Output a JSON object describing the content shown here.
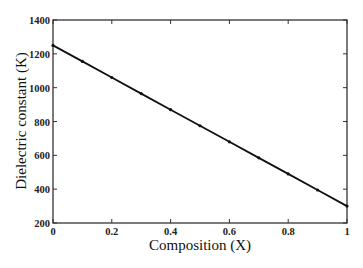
{
  "chart_data": {
    "type": "line",
    "title": "",
    "xlabel": "Composition (X)",
    "ylabel": "Dielectric constant (K)",
    "xlim": [
      0,
      1
    ],
    "ylim": [
      200,
      1400
    ],
    "grid": false,
    "legend": null,
    "xticks": [
      0,
      0.2,
      0.4,
      0.6,
      0.8,
      1
    ],
    "xtick_labels": [
      "0",
      "0.2",
      "0.4",
      "0.6",
      "0.8",
      "1"
    ],
    "yticks": [
      200,
      400,
      600,
      800,
      1000,
      1200,
      1400
    ],
    "ytick_labels": [
      "200",
      "400",
      "600",
      "800",
      "1000",
      "1200",
      "1400"
    ],
    "series": [
      {
        "name": "Dielectric constant",
        "color": "#111111",
        "marker": "dot",
        "x": [
          0,
          0.1,
          0.2,
          0.3,
          0.4,
          0.5,
          0.6,
          0.7,
          0.8,
          0.9,
          1.0
        ],
        "y": [
          1250,
          1155,
          1060,
          965,
          870,
          775,
          680,
          585,
          490,
          395,
          300
        ]
      }
    ]
  }
}
